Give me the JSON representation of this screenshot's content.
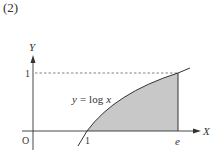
{
  "problem_number": "(2)",
  "axes": {
    "x_label": "X",
    "y_label": "Y",
    "origin_label": "O"
  },
  "ticks": {
    "x_one": "1",
    "x_e": "e",
    "y_one": "1"
  },
  "curve": {
    "label_y": "y",
    "label_eq": "=",
    "label_fn": "log",
    "label_x": "x",
    "function": "y = log x"
  },
  "colors": {
    "shade": "#c8c8c8",
    "line": "#333333",
    "dashed": "#555555"
  },
  "shaded_region": "area under y = log x from x = 1 to x = e"
}
